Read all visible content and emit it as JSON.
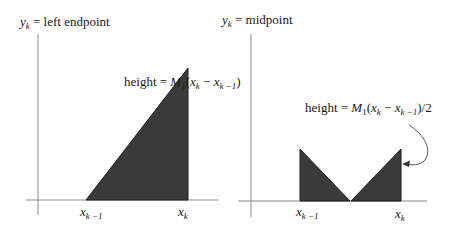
{
  "diagram": {
    "left_panel": {
      "title_prefix": "y",
      "title_sub": "k",
      "title_suffix": " = left endpoint",
      "height_label": {
        "prefix": "height = ",
        "M": "M",
        "M_sub": "1",
        "open": "(",
        "x1": "x",
        "x1_sub": "k",
        "minus": " − ",
        "x2": "x",
        "x2_sub": "k −1",
        "close": ")"
      },
      "tick_left": {
        "x": "x",
        "sub": "k −1"
      },
      "tick_right": {
        "x": "x",
        "sub": "k"
      },
      "shape": "right triangle rising from x_{k-1} to x_k"
    },
    "right_panel": {
      "title_prefix": "y",
      "title_sub": "k",
      "title_suffix": " = midpoint",
      "height_label": {
        "prefix": "height = ",
        "M": "M",
        "M_sub": "1",
        "open": "(",
        "x1": "x",
        "x1_sub": "k",
        "minus": " − ",
        "x2": "x",
        "x2_sub": "k −1",
        "close": ")/2"
      },
      "tick_left": {
        "x": "x",
        "sub": "k −1"
      },
      "tick_right": {
        "x": "x",
        "sub": "k"
      },
      "shape": "two triangles forming a V meeting at midpoint"
    },
    "colors": {
      "fill": "#3a3a3a",
      "axis": "#8a8a8a",
      "text": "#1a1a1a"
    }
  }
}
